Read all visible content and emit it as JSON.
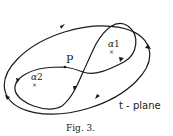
{
  "figure": {
    "caption": "Fig. 3.",
    "plane_label": "t - plane",
    "point_label": "P",
    "singularities": [
      {
        "name": "α",
        "index": "1",
        "marker": "×"
      },
      {
        "name": "α",
        "index": "2",
        "marker": "×"
      }
    ]
  },
  "colors": {
    "stroke": "#1a1a1a",
    "background": "#ffffff"
  }
}
